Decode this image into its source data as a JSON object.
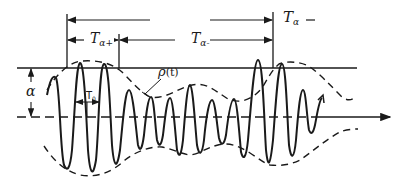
{
  "diagram": {
    "type": "level-crossing waveform",
    "labels": {
      "T_alpha": {
        "main": "T",
        "sub": "α"
      },
      "T_alpha_plus": {
        "main": "T",
        "sub": "α+"
      },
      "T_alpha_minus": {
        "main": "T",
        "sub": "α-"
      },
      "alpha": "α",
      "envelope": {
        "main": "ρ",
        "arg": "(t)"
      },
      "carrier_period": {
        "main": "T",
        "sub": "0"
      }
    },
    "colors": {
      "ink": "#1a1a1a",
      "background": "#ffffff"
    }
  }
}
